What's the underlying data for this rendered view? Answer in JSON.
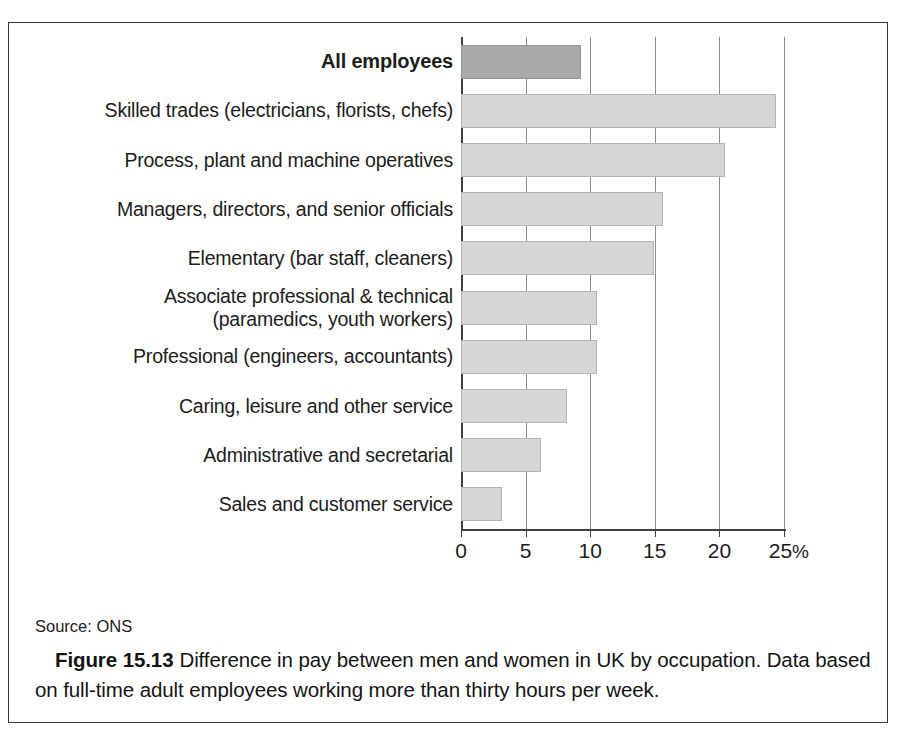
{
  "figure": {
    "source_label": "Source: ONS",
    "figure_number": "Figure 15.13",
    "caption_text": "Difference in pay between men and women in UK by occupation. Data based on full-time adult employees working more than thirty hours per week."
  },
  "chart_data": {
    "type": "bar",
    "orientation": "horizontal",
    "title": "",
    "xlabel": "",
    "ylabel": "",
    "xlim": [
      0,
      25
    ],
    "grid": true,
    "legend": "none",
    "unit": "%",
    "tick_labels": [
      "0",
      "5",
      "10",
      "15",
      "20",
      "25"
    ],
    "tick_values": [
      0,
      5,
      10,
      15,
      20,
      25
    ],
    "axis_suffix": "%",
    "categories": [
      "All employees",
      "Skilled trades (electricians, florists, chefs)",
      "Process, plant and machine operatives",
      "Managers, directors, and senior officials",
      "Elementary (bar staff, cleaners)",
      "Associate professional & technical\n(paramedics, youth workers)",
      "Professional (engineers, accountants)",
      "Caring, leisure and other service",
      "Administrative and secretarial",
      "Sales and customer service"
    ],
    "values": [
      9.3,
      24.4,
      20.4,
      15.6,
      14.9,
      10.5,
      10.5,
      8.2,
      6.2,
      3.2
    ],
    "highlight_index": 0,
    "colors": {
      "bar_fill": "#d6d6d6",
      "bar_stroke": "#b4b4b4",
      "highlight_fill": "#a9a9a9",
      "highlight_stroke": "#949494",
      "axis": "#3f3f3f",
      "gridline": "#8d8d8d",
      "text": "#1c1c1c",
      "frame": "#3a3a3a"
    }
  }
}
